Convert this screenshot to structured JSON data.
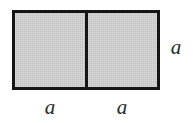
{
  "figure": {
    "background_color": "#ffffff",
    "shape": {
      "name": "two-squares-rectangle",
      "fill_color": "#c9c9c9",
      "stroke_color": "#151515",
      "stroke_width_px": 3,
      "cells": [
        {
          "name": "left-square"
        },
        {
          "name": "right-square"
        }
      ]
    },
    "labels": {
      "bottom_left": "a",
      "bottom_right": "a",
      "right_side": "a",
      "text_color": "#2b2b2b"
    }
  }
}
